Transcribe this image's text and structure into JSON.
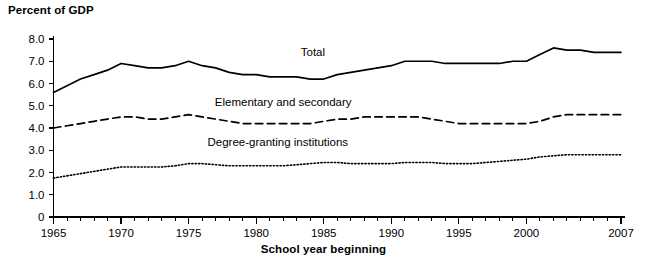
{
  "chart_data": {
    "type": "line",
    "title": "Percent of GDP",
    "xlabel": "School year beginning",
    "ylabel": "Percent of GDP",
    "xlim": [
      1965,
      2007
    ],
    "ylim": [
      0,
      8.0
    ],
    "grid": false,
    "legend_position": "inline-labels",
    "y_ticks": [
      "0",
      "1.0",
      "2.0",
      "3.0",
      "4.0",
      "5.0",
      "6.0",
      "7.0",
      "8.0"
    ],
    "y_tick_values": [
      0,
      1.0,
      2.0,
      3.0,
      4.0,
      5.0,
      6.0,
      7.0,
      8.0
    ],
    "x_ticks": [
      "1965",
      "1970",
      "1975",
      "1980",
      "1985",
      "1990",
      "1995",
      "2000",
      "2007"
    ],
    "x_tick_values": [
      1965,
      1970,
      1975,
      1980,
      1985,
      1990,
      1995,
      2000,
      2007
    ],
    "x": [
      1965,
      1966,
      1967,
      1968,
      1969,
      1970,
      1971,
      1972,
      1973,
      1974,
      1975,
      1976,
      1977,
      1978,
      1979,
      1980,
      1981,
      1982,
      1983,
      1984,
      1985,
      1986,
      1987,
      1988,
      1989,
      1990,
      1991,
      1992,
      1993,
      1994,
      1995,
      1996,
      1997,
      1998,
      1999,
      2000,
      2001,
      2002,
      2003,
      2004,
      2005,
      2006,
      2007
    ],
    "series": [
      {
        "name": "Total",
        "style": "solid",
        "label": "Total",
        "label_x": 1984.2,
        "label_y": 7.25,
        "values": [
          5.6,
          5.9,
          6.2,
          6.4,
          6.6,
          6.9,
          6.8,
          6.7,
          6.7,
          6.8,
          7.0,
          6.8,
          6.7,
          6.5,
          6.4,
          6.4,
          6.3,
          6.3,
          6.3,
          6.2,
          6.2,
          6.4,
          6.5,
          6.6,
          6.7,
          6.8,
          7.0,
          7.0,
          7.0,
          6.9,
          6.9,
          6.9,
          6.9,
          6.9,
          7.0,
          7.0,
          7.3,
          7.6,
          7.5,
          7.5,
          7.4,
          7.4,
          7.4
        ]
      },
      {
        "name": "Elementary and secondary",
        "style": "dashed",
        "label": "Elementary and secondary",
        "label_x": 1982.0,
        "label_y": 5.0,
        "values": [
          4.0,
          4.1,
          4.2,
          4.3,
          4.4,
          4.5,
          4.5,
          4.4,
          4.4,
          4.5,
          4.6,
          4.5,
          4.4,
          4.3,
          4.2,
          4.2,
          4.2,
          4.2,
          4.2,
          4.2,
          4.3,
          4.4,
          4.4,
          4.5,
          4.5,
          4.5,
          4.5,
          4.5,
          4.4,
          4.3,
          4.2,
          4.2,
          4.2,
          4.2,
          4.2,
          4.2,
          4.3,
          4.5,
          4.6,
          4.6,
          4.6,
          4.6,
          4.6
        ]
      },
      {
        "name": "Degree-granting institutions",
        "style": "dotted",
        "label": "Degree-granting institutions",
        "label_x": 1981.6,
        "label_y": 3.2,
        "values": [
          1.75,
          1.85,
          1.95,
          2.05,
          2.15,
          2.25,
          2.25,
          2.25,
          2.25,
          2.3,
          2.4,
          2.4,
          2.35,
          2.3,
          2.3,
          2.3,
          2.3,
          2.3,
          2.35,
          2.4,
          2.45,
          2.45,
          2.4,
          2.4,
          2.4,
          2.4,
          2.45,
          2.45,
          2.45,
          2.4,
          2.4,
          2.4,
          2.45,
          2.5,
          2.55,
          2.6,
          2.7,
          2.75,
          2.8,
          2.8,
          2.8,
          2.8,
          2.8
        ]
      }
    ]
  }
}
